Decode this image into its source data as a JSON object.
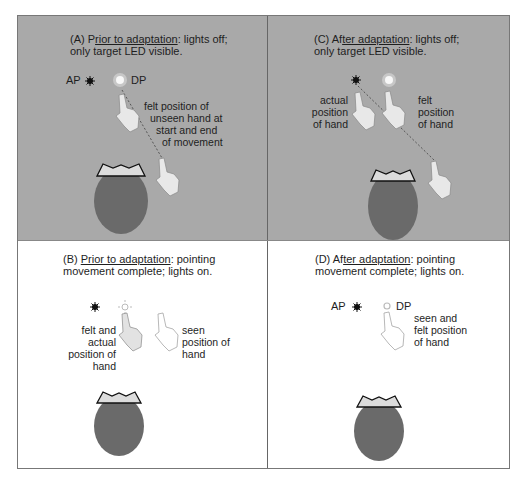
{
  "figure": {
    "panels": [
      {
        "id": "A",
        "prefix": "(A) P",
        "underlined": "rior to adaptation",
        "suffix": ": lights off;",
        "line2": "only target LED visible.",
        "background": "#a9a9a9",
        "labels": {
          "ap": "AP",
          "dp": "DP",
          "felt": [
            "felt position of",
            "unseen hand at",
            "start and end",
            "of movement"
          ]
        }
      },
      {
        "id": "C",
        "prefix": "(C) Af",
        "underlined": "ter adaptation",
        "suffix": ": lights off;",
        "line2": "only target LED visible.",
        "background": "#a9a9a9",
        "labels": {
          "actual": [
            "actual",
            "position",
            "of hand"
          ],
          "felt": [
            "felt",
            "position",
            "of hand"
          ]
        }
      },
      {
        "id": "B",
        "prefix": "(B) ",
        "underlined": "Prior to adaptation",
        "suffix": ": pointing",
        "line2": "movement complete; lights on.",
        "background": "#ffffff",
        "labels": {
          "felt_actual": [
            "felt and",
            "actual",
            "position of",
            "hand"
          ],
          "seen": [
            "seen",
            "position of",
            "hand"
          ]
        }
      },
      {
        "id": "D",
        "prefix": "(D) Af",
        "underlined": "ter adaptation",
        "suffix": ": pointing",
        "line2": "movement complete; lights on.",
        "background": "#ffffff",
        "labels": {
          "ap": "AP",
          "dp": "DP",
          "seen_felt": [
            "seen and",
            "felt position",
            "of hand"
          ]
        }
      }
    ]
  }
}
